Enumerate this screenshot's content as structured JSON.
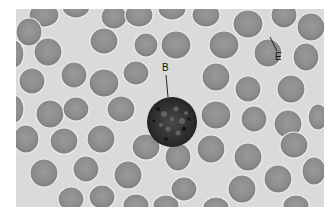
{
  "figure": {
    "background_color": "#d9d9d9",
    "cell_color": "#8f8f8f",
    "labels": [
      {
        "id": "B",
        "text": "B",
        "target": "leukocyte (basophil)"
      },
      {
        "id": "E",
        "text": "E",
        "target": "erythrocyte"
      }
    ]
  }
}
